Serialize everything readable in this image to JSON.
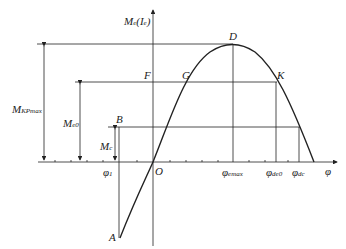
{
  "diagram": {
    "y_axis_label": {
      "main": "M",
      "sub": "e",
      "arg": "(I",
      "arg_sub": "e",
      "close": ")"
    },
    "x_axis_label": "φ",
    "points": {
      "A": "A",
      "B": "B",
      "D": "D",
      "F": "F",
      "G": "G",
      "K": "K",
      "O": "O"
    },
    "x_ticks": [
      {
        "main": "φ",
        "sub": "1"
      },
      {
        "main": "φ",
        "sub": "emax"
      },
      {
        "main": "φ",
        "sub": "de0"
      },
      {
        "main": "φ",
        "sub": "dc"
      }
    ],
    "dimension_labels": [
      {
        "main": "M",
        "sub": "KPmax"
      },
      {
        "main": "M",
        "sub": "e0"
      },
      {
        "main": "M",
        "sub": "c"
      }
    ],
    "line_color": "#222222"
  }
}
